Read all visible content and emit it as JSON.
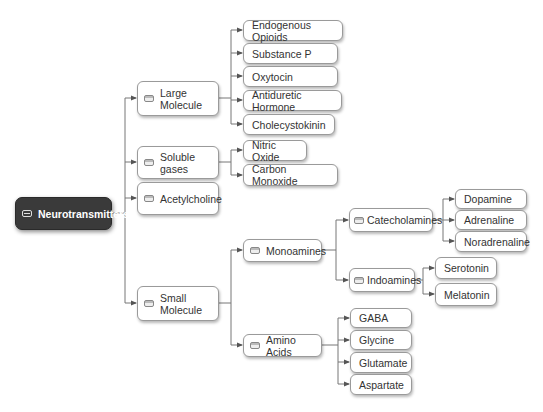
{
  "root": {
    "label": "Neurotransmitters"
  },
  "branches": {
    "large_molecule": {
      "label": "Large Molecule",
      "children": [
        "Endogenous Opioids",
        "Substance P",
        "Oxytocin",
        "Antiduretic Hormone",
        "Cholecystokinin"
      ]
    },
    "soluble_gases": {
      "label": "Soluble gases",
      "children": [
        "Nitric Oxide",
        "Carbon Monoxide"
      ]
    },
    "acetylcholine": {
      "label": "Acetylcholine"
    },
    "small_molecule": {
      "label": "Small Molecule",
      "monoamines": {
        "label": "Monoamines",
        "catecholamines": {
          "label": "Catecholamines",
          "children": [
            "Dopamine",
            "Adrenaline",
            "Noradrenaline"
          ]
        },
        "indoamines": {
          "label": "Indoamines",
          "children": [
            "Serotonin",
            "Melatonin"
          ]
        }
      },
      "amino_acids": {
        "label": "Amino Acids",
        "children": [
          "GABA",
          "Glycine",
          "Glutamate",
          "Aspartate"
        ]
      }
    }
  }
}
